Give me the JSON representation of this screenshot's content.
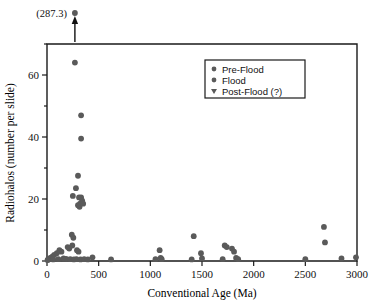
{
  "chart_data": {
    "type": "scatter",
    "title": "",
    "xlabel": "Conventional Age (Ma)",
    "ylabel": "Radiohalos (number per slide)",
    "xlim": [
      0,
      3000
    ],
    "ylim": [
      0,
      70
    ],
    "xticks": [
      0,
      500,
      1000,
      1500,
      2000,
      2500,
      3000
    ],
    "yticks": [
      0,
      20,
      40,
      60
    ],
    "xtick_labels": [
      "0",
      "500",
      "1000",
      "1500",
      "2000",
      "2500",
      "3000"
    ],
    "ytick_labels": [
      "0",
      "20",
      "40",
      "60"
    ],
    "grid": false,
    "legend_position": "upper-center",
    "marker_color": "#5a5a5a",
    "axis_color": "#1a1a1a",
    "legend": [
      {
        "label": "Pre-Flood",
        "marker": "circle"
      },
      {
        "label": "Flood",
        "marker": "circle"
      },
      {
        "label": "Post-Flood (?)",
        "marker": "triangle-down"
      }
    ],
    "annotations": [
      {
        "text": "(287.3)",
        "x": 270,
        "y": 70,
        "note": "off-scale point above plot top, arrow points up"
      }
    ],
    "series": [
      {
        "name": "Radiohalos",
        "points": [
          [
            270,
            64.0
          ],
          [
            330,
            47.0
          ],
          [
            330,
            39.5
          ],
          [
            300,
            27.5
          ],
          [
            280,
            23.5
          ],
          [
            250,
            21.0
          ],
          [
            310,
            20.5
          ],
          [
            330,
            20.5
          ],
          [
            340,
            19.5
          ],
          [
            320,
            18.5
          ],
          [
            315,
            17.5
          ],
          [
            300,
            18.0
          ],
          [
            350,
            18.5
          ],
          [
            240,
            8.5
          ],
          [
            255,
            7.5
          ],
          [
            245,
            5.0
          ],
          [
            200,
            4.5
          ],
          [
            215,
            4.0
          ],
          [
            290,
            3.5
          ],
          [
            305,
            3.0
          ],
          [
            120,
            3.5
          ],
          [
            140,
            3.0
          ],
          [
            95,
            2.5
          ],
          [
            70,
            2.0
          ],
          [
            55,
            1.5
          ],
          [
            45,
            1.2
          ],
          [
            35,
            1.0
          ],
          [
            25,
            0.8
          ],
          [
            15,
            0.6
          ],
          [
            10,
            0.4
          ],
          [
            5,
            0.3
          ],
          [
            60,
            0.5
          ],
          [
            110,
            0.6
          ],
          [
            160,
            0.8
          ],
          [
            185,
            0.7
          ],
          [
            225,
            0.6
          ],
          [
            260,
            0.5
          ],
          [
            285,
            0.6
          ],
          [
            325,
            0.5
          ],
          [
            360,
            0.6
          ],
          [
            395,
            0.5
          ],
          [
            440,
            1.2
          ],
          [
            620,
            0.5
          ],
          [
            1050,
            0.6
          ],
          [
            1090,
            3.5
          ],
          [
            1100,
            1.0
          ],
          [
            1110,
            0.6
          ],
          [
            1400,
            0.5
          ],
          [
            1420,
            8.0
          ],
          [
            1490,
            2.5
          ],
          [
            1500,
            0.8
          ],
          [
            1700,
            0.6
          ],
          [
            1720,
            5.0
          ],
          [
            1740,
            4.5
          ],
          [
            1790,
            4.0
          ],
          [
            1810,
            3.0
          ],
          [
            1830,
            1.0
          ],
          [
            1850,
            0.6
          ],
          [
            2500,
            0.6
          ],
          [
            2680,
            11.0
          ],
          [
            2690,
            6.0
          ],
          [
            2850,
            0.8
          ],
          [
            2990,
            1.2
          ]
        ]
      }
    ]
  }
}
